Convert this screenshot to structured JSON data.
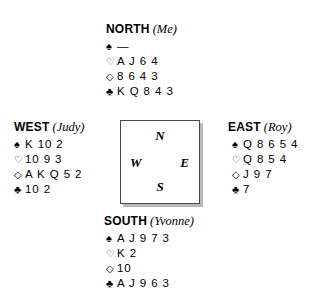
{
  "diagram": {
    "type": "bridge-hand-diagram",
    "compass": {
      "north": "N",
      "east": "E",
      "south": "S",
      "west": "W"
    },
    "suit_symbols": {
      "spade": "♠",
      "heart": "♡",
      "diamond": "◇",
      "club": "♣"
    },
    "hands": {
      "north": {
        "seat": "NORTH",
        "player": "(Me)",
        "spades": "—",
        "hearts": "A J 6 4",
        "diamonds": "8 6 4 3",
        "clubs": "K Q 8 4 3"
      },
      "west": {
        "seat": "WEST",
        "player": "(Judy)",
        "spades": "K 10 2",
        "hearts": "10 9 3",
        "diamonds": "A K Q 5 2",
        "clubs": "10 2"
      },
      "east": {
        "seat": "EAST",
        "player": "(Roy)",
        "spades": "Q 8 6 5 4",
        "hearts": "Q 8 5 4",
        "diamonds": "J 9 7",
        "clubs": "7"
      },
      "south": {
        "seat": "SOUTH",
        "player": "(Yvonne)",
        "spades": "A J 9 7 3",
        "hearts": "K 2",
        "diamonds": "10",
        "clubs": "A J 9 6 3"
      }
    }
  }
}
